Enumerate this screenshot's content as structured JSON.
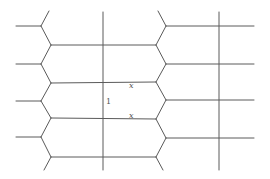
{
  "diagram": {
    "type": "lattice-tiling",
    "stroke_color": "#5a5a5a",
    "background": "#ffffff",
    "labels": [
      {
        "id": "label-x-upper",
        "text": "x",
        "x": 129,
        "y": 88
      },
      {
        "id": "label-one",
        "text": "1",
        "x": 106,
        "y": 104
      },
      {
        "id": "label-x-lower",
        "text": "x",
        "x": 129,
        "y": 118
      }
    ],
    "left_zigzag": {
      "outer_x": 41,
      "inner_x": 51,
      "vertices_outer_y": [
        26,
        64,
        101,
        137
      ],
      "vertices_inner_y": [
        45,
        83,
        118,
        157
      ],
      "top_tail": [
        [
          41,
          26
        ],
        [
          49,
          11
        ]
      ],
      "bottom_tail": [
        [
          51,
          157
        ],
        [
          44,
          170
        ]
      ],
      "left_stubs_to_x": 16
    },
    "right_zigzag": {
      "outer_x": 166,
      "inner_x": 156,
      "vertices_outer_y": [
        26,
        64,
        100,
        138
      ],
      "vertices_inner_y": [
        45,
        82,
        119,
        157
      ],
      "top_tail": [
        [
          166,
          26
        ],
        [
          158,
          11
        ]
      ],
      "bottom_tail": [
        [
          156,
          157
        ],
        [
          163,
          170
        ]
      ],
      "right_stubs_to_x": 254
    },
    "middle_horizontals_y": [
      45,
      82,
      119,
      157
    ],
    "middle_horizontals_x": [
      51,
      156
    ],
    "verticals": [
      {
        "x": 103,
        "y1": 12,
        "y2": 170
      },
      {
        "x": 219,
        "y1": 12,
        "y2": 170
      }
    ]
  }
}
